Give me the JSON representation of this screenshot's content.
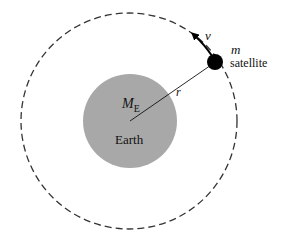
{
  "diagram": {
    "earth": {
      "label": "Earth",
      "mass_label": "M",
      "mass_subscript": "E",
      "color": "#a8a8a8"
    },
    "satellite": {
      "mass_label": "m",
      "label": "satellite",
      "color": "#000000"
    },
    "radius_label": "r",
    "velocity_label": "v",
    "orbit_style": "dashed"
  }
}
